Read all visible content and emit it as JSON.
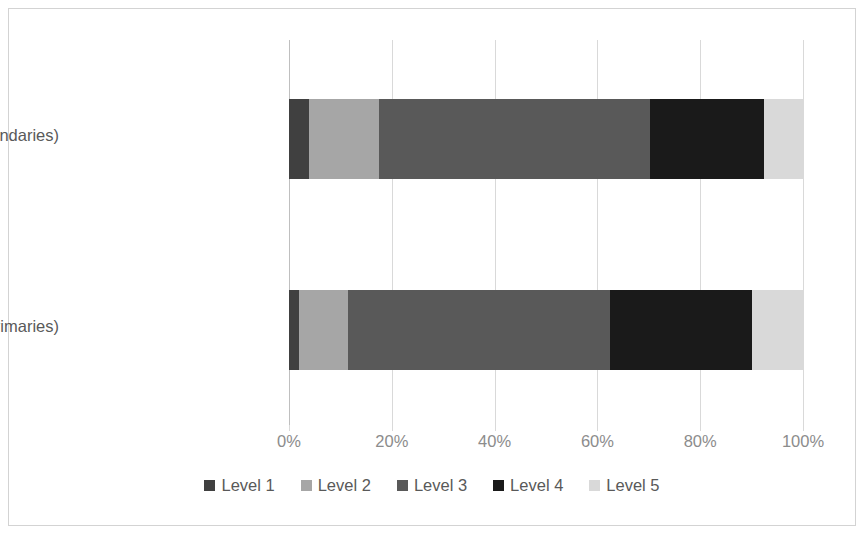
{
  "chart_data": {
    "type": "bar",
    "orientation": "horizontal",
    "stacked": true,
    "stack_mode": "percent",
    "title": "",
    "xlabel": "",
    "ylabel": "",
    "xlim": [
      0,
      100
    ],
    "xticks": [
      0,
      20,
      40,
      60,
      80,
      100
    ],
    "xtick_labels": [
      "0%",
      "20%",
      "40%",
      "60%",
      "80%",
      "100%"
    ],
    "grid": true,
    "grid_axis": "x",
    "legend_position": "bottom",
    "categories": [
      "Personal Data (Secondaries)",
      "Personal Data (Primaries)"
    ],
    "series": [
      {
        "name": "Level 1",
        "color": "#404040",
        "values": [
          3.9,
          1.9
        ]
      },
      {
        "name": "Level 2",
        "color": "#a6a6a6",
        "values": [
          13.6,
          9.6
        ]
      },
      {
        "name": "Level 3",
        "color": "#595959",
        "values": [
          52.7,
          51.0
        ]
      },
      {
        "name": "Level 4",
        "color": "#1a1a1a",
        "values": [
          22.2,
          27.6
        ]
      },
      {
        "name": "Level 5",
        "color": "#d9d9d9",
        "values": [
          7.6,
          9.9
        ]
      }
    ]
  },
  "axis": {
    "ticks": [
      {
        "label": "0%",
        "value": 0
      },
      {
        "label": "20%",
        "value": 20
      },
      {
        "label": "40%",
        "value": 40
      },
      {
        "label": "60%",
        "value": 60
      },
      {
        "label": "80%",
        "value": 80
      },
      {
        "label": "100%",
        "value": 100
      }
    ]
  },
  "categories": [
    {
      "label": "Personal Data (Secondaries)"
    },
    {
      "label": "Personal Data (Primaries)"
    }
  ],
  "legend": [
    {
      "label": "Level 1",
      "color": "#404040"
    },
    {
      "label": "Level 2",
      "color": "#a6a6a6"
    },
    {
      "label": "Level 3",
      "color": "#595959"
    },
    {
      "label": "Level 4",
      "color": "#1a1a1a"
    },
    {
      "label": "Level 5",
      "color": "#d9d9d9"
    }
  ],
  "colors": {
    "plot_background": "#ffffff",
    "frame_border": "#d3d3d3",
    "gridline": "#d9d9d9",
    "axis_line": "#bfbfbf",
    "category_text": "#595959",
    "tick_text": "#8c8c8c"
  }
}
